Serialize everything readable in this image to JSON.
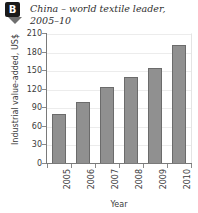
{
  "badge": {
    "letter": "B",
    "pointer_icon": "triangle-down-icon"
  },
  "chart_data": {
    "type": "bar",
    "title": "China – world textile leader, 2005–10",
    "xlabel": "Year",
    "ylabel": "Industrial value-added, US$",
    "categories": [
      "2005",
      "2006",
      "2007",
      "2008",
      "2009",
      "2010"
    ],
    "values": [
      80,
      100,
      125,
      140,
      155,
      192
    ],
    "ylim": [
      0,
      210
    ],
    "yticks": [
      0,
      30,
      60,
      90,
      120,
      150,
      180,
      210
    ],
    "ytick_labels": [
      "0",
      "30",
      "60",
      "90",
      "120",
      "150",
      "180",
      "210"
    ],
    "grid": true,
    "legend": "none",
    "bar_color": "#909090",
    "bar_border_color": "#6b6b6b",
    "gridline_color": "#ececec",
    "axis_color": "#7a7a7a"
  }
}
